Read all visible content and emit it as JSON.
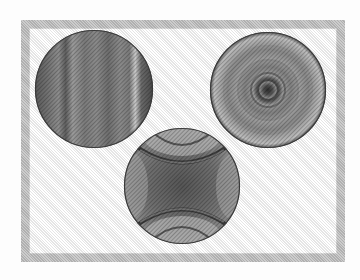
{
  "figure": {
    "frame": {
      "color": "#c4c4c4"
    },
    "circles": [
      {
        "id": "left",
        "pattern": "vertical-bands",
        "cx": 94,
        "cy": 89,
        "r": 59
      },
      {
        "id": "right",
        "pattern": "concentric-rings",
        "cx": 268,
        "cy": 90,
        "r": 58
      },
      {
        "id": "bottom",
        "pattern": "hyperbolic-cross",
        "cx": 182,
        "cy": 186,
        "r": 58
      }
    ]
  }
}
